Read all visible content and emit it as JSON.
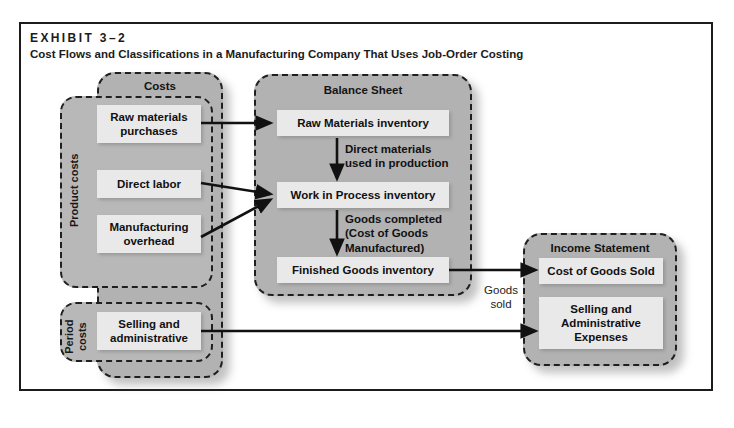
{
  "exhibit": {
    "label": "EXHIBIT 3–2",
    "title": "Cost Flows and Classifications in a Manufacturing Company That Uses Job-Order Costing"
  },
  "panels": {
    "costs": {
      "title": "Costs"
    },
    "balance_sheet": {
      "title": "Balance Sheet"
    },
    "income_statement": {
      "title": "Income Statement"
    }
  },
  "subpanels": {
    "product_costs": {
      "caption": "Product costs"
    },
    "period_costs": {
      "caption": "Period\ncosts"
    }
  },
  "cost_items": [
    {
      "label": "Raw materials\npurchases"
    },
    {
      "label": "Direct labor"
    },
    {
      "label": "Manufacturing\noverhead"
    },
    {
      "label": "Selling and\nadministrative"
    }
  ],
  "balance_sheet_items": [
    {
      "label": "Raw Materials inventory"
    },
    {
      "label": "Work in Process inventory"
    },
    {
      "label": "Finished Goods inventory"
    }
  ],
  "income_statement_items": [
    {
      "label": "Cost of Goods Sold"
    },
    {
      "label": "Selling and\nAdministrative\nExpenses"
    }
  ],
  "flow_labels": [
    {
      "label": "Direct materials\nused in production"
    },
    {
      "label": "Goods completed\n(Cost of Goods\nManufactured)"
    },
    {
      "label": "Goods\nsold"
    }
  ],
  "colors": {
    "panel_fill": "#b2b2b2",
    "subpanel_fill": "#b8b8b8",
    "item_fill": "#e9e9e9",
    "stroke": "#1f1f1f",
    "frame": "#1c1c1c",
    "text": "#111111",
    "page": "#ffffff"
  }
}
